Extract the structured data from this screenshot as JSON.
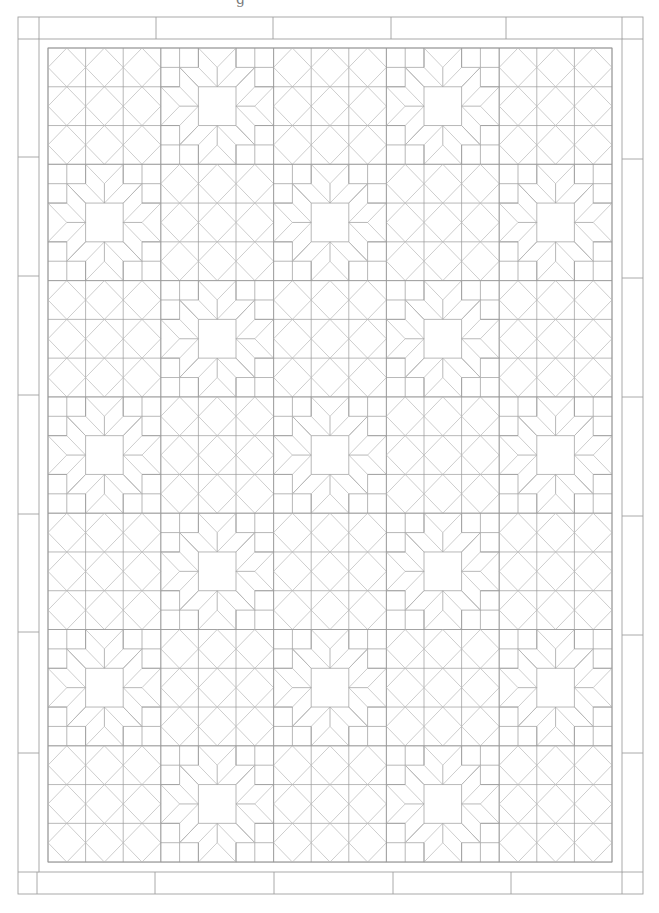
{
  "caption_fragment": "g",
  "quilt": {
    "colors": {
      "background": "#ffffff",
      "grid_line": "#9a9a9a",
      "diagonal_line": "#b8b8b8",
      "border_line": "#a0a0a0"
    },
    "outer_border": {
      "left": 18,
      "right": 643,
      "top": 17,
      "bottom": 894,
      "inner_left": 39,
      "inner_right": 622,
      "inner_top": 39,
      "inner_bottom": 872,
      "top_dividers": [
        39,
        156,
        273,
        391,
        506,
        622
      ],
      "bottom_dividers": [
        37,
        155,
        274,
        393,
        511,
        622
      ],
      "left_dividers": [
        39,
        157,
        276,
        395,
        514,
        632,
        753,
        872
      ],
      "right_dividers": [
        39,
        159,
        278,
        397,
        516,
        635,
        753,
        872
      ]
    },
    "inner_border": {
      "left": 48,
      "right": 612,
      "top": 48,
      "bottom": 862
    },
    "blocks": {
      "columns": 5,
      "rows": 7,
      "x0": 48,
      "y0": 48,
      "block_width": 112.8,
      "block_height": 116.3,
      "layout": [
        [
          "diamond",
          "star",
          "diamond",
          "star",
          "diamond"
        ],
        [
          "star",
          "diamond",
          "star",
          "diamond",
          "star"
        ],
        [
          "diamond",
          "star",
          "diamond",
          "star",
          "diamond"
        ],
        [
          "star",
          "diamond",
          "star",
          "diamond",
          "star"
        ],
        [
          "diamond",
          "star",
          "diamond",
          "star",
          "diamond"
        ],
        [
          "star",
          "diamond",
          "star",
          "diamond",
          "star"
        ],
        [
          "diamond",
          "star",
          "diamond",
          "star",
          "diamond"
        ]
      ]
    },
    "block_types": {
      "diamond": {
        "name": "square-in-square 9-patch",
        "units": 3
      },
      "star": {
        "name": "eight-point star with center square",
        "units": 6
      }
    }
  }
}
